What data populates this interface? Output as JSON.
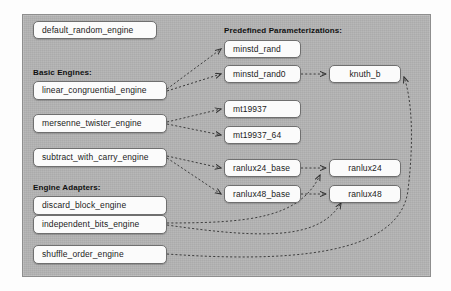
{
  "diagram": {
    "frame": {
      "background_color": "#b4b4b4",
      "border_color": "#8e8e8e"
    },
    "node_style": {
      "fill": "#fbfbfb",
      "border_color": "#6f6f6f",
      "text_color": "#1b1b1b"
    },
    "edge_style": {
      "color": "#3a3a3a",
      "dash": "2,2",
      "arrowhead": "open"
    },
    "labels": [
      {
        "id": "label-basic-engines",
        "text": "Basic Engines:"
      },
      {
        "id": "label-engine-adapters",
        "text": "Engine Adapters:"
      },
      {
        "id": "label-predefined",
        "text": "Predefined Parameterizations:"
      }
    ],
    "columns": {
      "left": {
        "name": "engines-column",
        "nodes": [
          {
            "id": "default_random_engine",
            "label": "default_random_engine",
            "group": "standalone"
          },
          {
            "id": "linear_congruential_engine",
            "label": "linear_congruential_engine",
            "group": "basic"
          },
          {
            "id": "mersenne_twister_engine",
            "label": "mersenne_twister_engine",
            "group": "basic"
          },
          {
            "id": "subtract_with_carry_engine",
            "label": "subtract_with_carry_engine",
            "group": "basic"
          },
          {
            "id": "discard_block_engine",
            "label": "discard_block_engine",
            "group": "adapter"
          },
          {
            "id": "independent_bits_engine",
            "label": "independent_bits_engine",
            "group": "adapter"
          },
          {
            "id": "shuffle_order_engine",
            "label": "shuffle_order_engine",
            "group": "adapter"
          }
        ]
      },
      "middle": {
        "name": "base-parameterizations-column",
        "nodes": [
          {
            "id": "minstd_rand",
            "label": "minstd_rand"
          },
          {
            "id": "minstd_rand0",
            "label": "minstd_rand0"
          },
          {
            "id": "mt19937",
            "label": "mt19937"
          },
          {
            "id": "mt19937_64",
            "label": "mt19937_64"
          },
          {
            "id": "ranlux24_base",
            "label": "ranlux24_base"
          },
          {
            "id": "ranlux48_base",
            "label": "ranlux48_base"
          }
        ]
      },
      "right": {
        "name": "adapted-parameterizations-column",
        "nodes": [
          {
            "id": "knuth_b",
            "label": "knuth_b"
          },
          {
            "id": "ranlux24",
            "label": "ranlux24"
          },
          {
            "id": "ranlux48",
            "label": "ranlux48"
          }
        ]
      }
    },
    "edges": [
      {
        "from": "linear_congruential_engine",
        "to": "minstd_rand"
      },
      {
        "from": "linear_congruential_engine",
        "to": "minstd_rand0"
      },
      {
        "from": "mersenne_twister_engine",
        "to": "mt19937"
      },
      {
        "from": "mersenne_twister_engine",
        "to": "mt19937_64"
      },
      {
        "from": "subtract_with_carry_engine",
        "to": "ranlux24_base"
      },
      {
        "from": "subtract_with_carry_engine",
        "to": "ranlux48_base"
      },
      {
        "from": "minstd_rand0",
        "to": "knuth_b"
      },
      {
        "from": "ranlux24_base",
        "to": "ranlux24"
      },
      {
        "from": "ranlux48_base",
        "to": "ranlux48"
      },
      {
        "from": "independent_bits_engine",
        "to": "ranlux24"
      },
      {
        "from": "independent_bits_engine",
        "to": "ranlux48"
      },
      {
        "from": "shuffle_order_engine",
        "to": "knuth_b"
      }
    ]
  }
}
